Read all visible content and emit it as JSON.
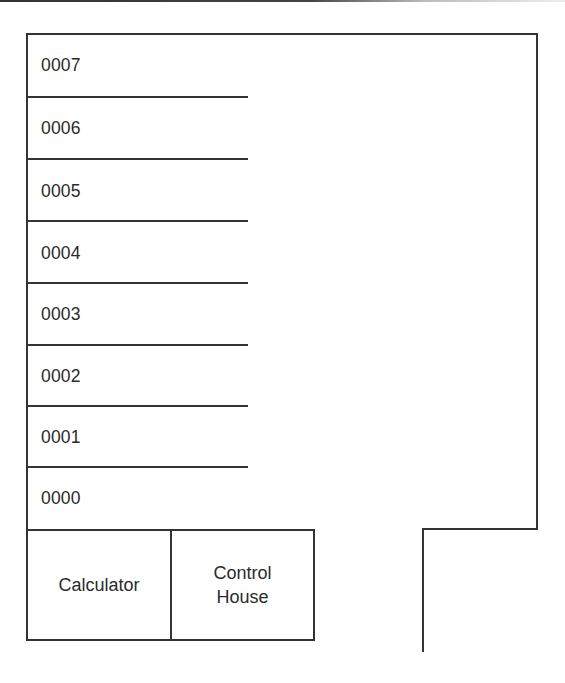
{
  "diagram": {
    "type": "floor-plan layout",
    "levels": [
      {
        "label": "0007"
      },
      {
        "label": "0006"
      },
      {
        "label": "0005"
      },
      {
        "label": "0004"
      },
      {
        "label": "0003"
      },
      {
        "label": "0002"
      },
      {
        "label": "0001"
      },
      {
        "label": "0000"
      }
    ],
    "rooms": [
      {
        "label": "Calculator"
      },
      {
        "label": "Control\nHouse"
      }
    ],
    "colors": {
      "line": "#333333",
      "text": "#2a2a2a",
      "background": "#ffffff"
    }
  }
}
